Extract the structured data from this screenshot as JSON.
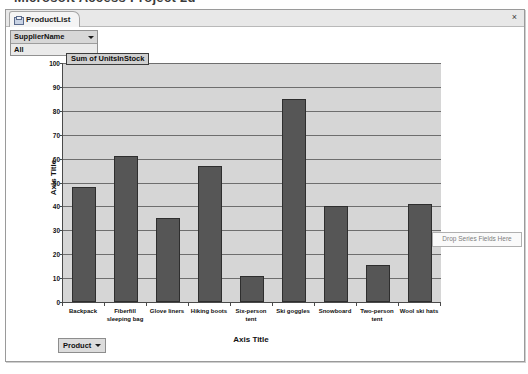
{
  "top_fragment": "Microsoft Access Project 2d",
  "window": {
    "tab_label": "ProductList",
    "tab_icon": "form-icon",
    "close_label": "×"
  },
  "filter": {
    "field_label": "SupplierName",
    "selected_value": "All",
    "caret_icon": "chevron-down-icon"
  },
  "drop_zone": {
    "label": "Drop Series Fields Here"
  },
  "footer": {
    "product_button_label": "Product",
    "caret_icon": "chevron-down-icon"
  },
  "chart_data": {
    "type": "bar",
    "title": "Sum of UnitsInStock",
    "xlabel": "Axis Title",
    "ylabel": "Axis Title",
    "ylim": [
      0,
      100
    ],
    "ytick_step": 10,
    "yticks": [
      "0",
      "10",
      "20",
      "30",
      "40",
      "50",
      "60",
      "70",
      "80",
      "90",
      "100"
    ],
    "grid": true,
    "legend": "none",
    "bar_color": "#565656",
    "plot_background": "#d6d6d6",
    "categories": [
      "Backpack",
      "Fiberfill sleeping bag",
      "Glove liners",
      "Hiking boots",
      "Six-person tent",
      "Ski goggles",
      "Snowboard",
      "Two-person tent",
      "Wool ski hats"
    ],
    "values": [
      48,
      61,
      35,
      57,
      11,
      85,
      40,
      15.5,
      41
    ]
  }
}
